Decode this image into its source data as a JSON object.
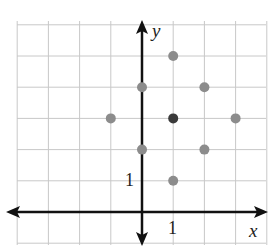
{
  "chart_data": {
    "type": "scatter",
    "title": "",
    "xlabel": "x",
    "ylabel": "y",
    "xlim": [
      -4,
      4
    ],
    "ylim": [
      -1,
      6
    ],
    "grid": true,
    "tick_labels": {
      "x": [
        "1"
      ],
      "y": [
        "1"
      ]
    },
    "series": [
      {
        "name": "points",
        "color": "#8c8c8c",
        "points": [
          [
            1,
            5
          ],
          [
            0,
            4
          ],
          [
            2,
            4
          ],
          [
            -1,
            3
          ],
          [
            3,
            3
          ],
          [
            0,
            2
          ],
          [
            2,
            2
          ],
          [
            1,
            1
          ]
        ]
      },
      {
        "name": "center",
        "color": "#3a3a3a",
        "points": [
          [
            1,
            3
          ]
        ]
      }
    ]
  },
  "labels": {
    "x": "x",
    "y": "y",
    "x_tick": "1",
    "y_tick": "1"
  }
}
